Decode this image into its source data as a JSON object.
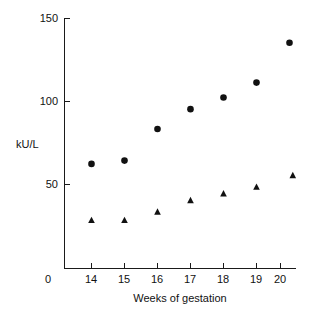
{
  "chart_data": {
    "type": "scatter",
    "title": "",
    "xlabel": "Weeks of gestation",
    "ylabel": "kU/L",
    "xlim": [
      13.4,
      21.2
    ],
    "ylim": [
      0,
      150
    ],
    "grid": false,
    "legend": "none",
    "x_ticks": [
      "14",
      "15",
      "16",
      "17",
      "18",
      "19",
      "20"
    ],
    "x_tick_values": [
      14,
      15,
      16,
      17,
      18,
      19,
      20
    ],
    "x_origin_label": "0",
    "y_ticks": [
      "50",
      "100",
      "150"
    ],
    "y_tick_values": [
      50,
      100,
      150
    ],
    "categories": [
      14,
      15,
      16,
      17,
      18,
      19,
      20
    ],
    "series": [
      {
        "name": "circle-series",
        "marker": "circle",
        "color": "#111111",
        "x": [
          14,
          15,
          16,
          17,
          18,
          19,
          20
        ],
        "values": [
          63,
          65,
          84,
          96,
          103,
          112,
          136
        ]
      },
      {
        "name": "triangle-series",
        "marker": "triangle",
        "color": "#111111",
        "x": [
          14,
          15,
          16,
          17,
          18,
          19,
          20.1
        ],
        "values": [
          29,
          29,
          34,
          41,
          45,
          49,
          56
        ]
      }
    ]
  },
  "axes": {
    "y_label_text": "kU/L",
    "x_label_text": "Weeks of gestation"
  }
}
